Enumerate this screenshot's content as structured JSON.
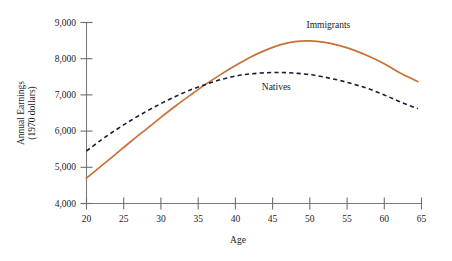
{
  "chart_data": {
    "type": "line",
    "title": "",
    "xlabel": "Age",
    "ylabel": "Annual Earnings\n(1970 dollars)",
    "ylabel_line1": "Annual Earnings",
    "ylabel_line2": "(1970 dollars)",
    "xlim": [
      20,
      65
    ],
    "ylim": [
      4000,
      9000
    ],
    "xticks": [
      20,
      25,
      30,
      35,
      40,
      45,
      50,
      55,
      60,
      65
    ],
    "xtick_labels": [
      "20",
      "25",
      "30",
      "35",
      "40",
      "45",
      "50",
      "55",
      "60",
      "65"
    ],
    "yticks": [
      4000,
      5000,
      6000,
      7000,
      8000,
      9000
    ],
    "ytick_labels": [
      "4,000",
      "5,000",
      "6,000",
      "7,000",
      "8,000",
      "9,000"
    ],
    "grid": false,
    "legend": "inline-annotations",
    "series": [
      {
        "name": "Immigrants",
        "color": "#C87137",
        "style": "solid",
        "label_position": {
          "x": 52.5,
          "y": 8850
        },
        "x": [
          20,
          22,
          24,
          26,
          28,
          30,
          32,
          34,
          36,
          38,
          40,
          42,
          44,
          46,
          48,
          50,
          52,
          54,
          56,
          58,
          60,
          62,
          64.5
        ],
        "values": [
          4700,
          5040,
          5380,
          5720,
          6050,
          6380,
          6700,
          7000,
          7290,
          7560,
          7810,
          8040,
          8230,
          8380,
          8470,
          8490,
          8450,
          8360,
          8230,
          8060,
          7860,
          7620,
          7370
        ]
      },
      {
        "name": "Natives",
        "color": "#1b1b3a",
        "style": "dashed",
        "label_position": {
          "x": 45.5,
          "y": 7150
        },
        "x": [
          20,
          22,
          24,
          26,
          28,
          30,
          32,
          34,
          36,
          38,
          40,
          42,
          44,
          46,
          48,
          50,
          52,
          54,
          56,
          58,
          60,
          62,
          64.5
        ],
        "values": [
          5450,
          5760,
          6040,
          6300,
          6540,
          6760,
          6960,
          7140,
          7290,
          7420,
          7520,
          7580,
          7610,
          7620,
          7600,
          7560,
          7490,
          7400,
          7290,
          7160,
          7000,
          6820,
          6620
        ]
      }
    ],
    "annotations": [
      {
        "name": "immigrants-label",
        "text": "Immigrants"
      },
      {
        "name": "natives-label",
        "text": "Natives"
      }
    ]
  }
}
